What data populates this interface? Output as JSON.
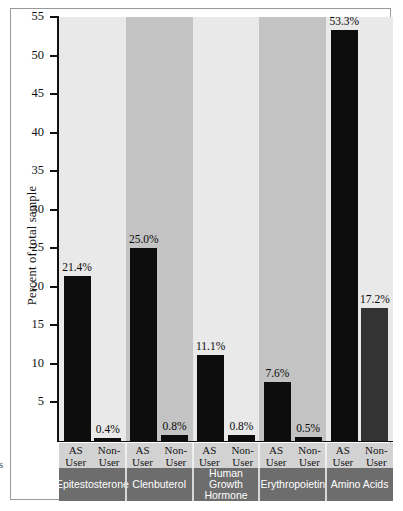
{
  "chart_data": {
    "type": "bar",
    "title": "",
    "xlabel": "",
    "ylabel": "Percent of total sample",
    "ylim": [
      0,
      55
    ],
    "yticks": [
      55,
      50,
      45,
      40,
      35,
      30,
      25,
      20,
      15,
      10,
      5
    ],
    "grid": false,
    "legend": "none",
    "categories": [
      "Epitestosterone",
      "Clenbuterol",
      "Human Growth Hormone",
      "Erythropoietin",
      "Amino Acids"
    ],
    "subgroups": [
      "AS User",
      "Non-User"
    ],
    "series": [
      {
        "name": "AS User",
        "values": [
          21.4,
          25.0,
          11.1,
          7.6,
          53.3
        ]
      },
      {
        "name": "Non-User",
        "values": [
          0.4,
          0.8,
          0.8,
          0.5,
          17.2
        ]
      }
    ],
    "data_labels": [
      [
        "21.4%",
        "0.4%"
      ],
      [
        "25.0%",
        "0.8%"
      ],
      [
        "11.1%",
        "0.8%"
      ],
      [
        "7.6%",
        "0.5%"
      ],
      [
        "53.3%",
        "17.2%"
      ]
    ],
    "colors": {
      "as_user_bar": "#0d0d0d",
      "non_user_bar": "#0d0d0d",
      "amino_acids_non_user_bar": "#333333",
      "band_light": "#e9e9e9",
      "band_dark": "#c3c3c3",
      "sub_band": "#d2d2d2",
      "category_band": "#6d6d6d",
      "axis": "#111111"
    }
  },
  "axis": {
    "y_label": "Percent of total sample",
    "ticks": [
      "55",
      "50",
      "45",
      "40",
      "35",
      "30",
      "25",
      "20",
      "15",
      "10",
      "5"
    ]
  },
  "sub_labels": [
    {
      "line1": "AS",
      "line2": "User"
    },
    {
      "line1": "Non-",
      "line2": "User"
    },
    {
      "line1": "AS",
      "line2": "User"
    },
    {
      "line1": "Non-",
      "line2": "User"
    },
    {
      "line1": "AS",
      "line2": "User"
    },
    {
      "line1": "Non-",
      "line2": "User"
    },
    {
      "line1": "AS",
      "line2": "User"
    },
    {
      "line1": "Non-",
      "line2": "User"
    },
    {
      "line1": "AS",
      "line2": "User"
    },
    {
      "line1": "Non-",
      "line2": "User"
    }
  ],
  "category_labels": [
    "Epitestosterone",
    "Clenbuterol",
    "Human Growth Hormone",
    "Erythropoietin",
    "Amino Acids"
  ],
  "edge_fragment": "s"
}
